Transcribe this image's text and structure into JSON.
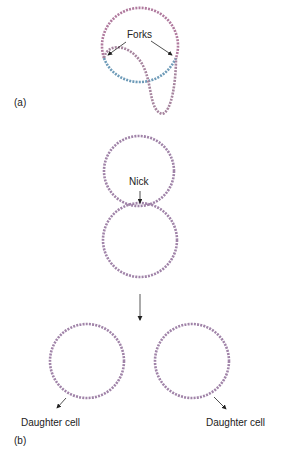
{
  "panel_a": {
    "label": "(a)",
    "forks_label": "Forks"
  },
  "panel_b": {
    "label": "(b)",
    "nick_label": "Nick",
    "daughter_left": "Daughter cell",
    "daughter_right": "Daughter cell"
  },
  "colors": {
    "strand_pink": "#b07a9e",
    "strand_purple": "#8a7fb0",
    "strand_blue": "#6e9bb8",
    "arrow": "#222222"
  }
}
